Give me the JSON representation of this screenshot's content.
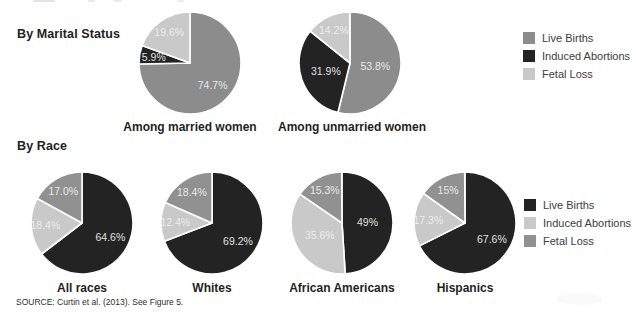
{
  "sections": {
    "marital": {
      "label": "By Marital Status"
    },
    "race": {
      "label": "By Race"
    }
  },
  "legend_top": {
    "items": [
      {
        "label": "Live Births",
        "color": "#8c8c8c"
      },
      {
        "label": "Induced Abortions",
        "color": "#232323"
      },
      {
        "label": "Fetal Loss",
        "color": "#c9c9c9"
      }
    ]
  },
  "legend_bottom": {
    "items": [
      {
        "label": "Live Births",
        "color": "#232323"
      },
      {
        "label": "Induced Abortions",
        "color": "#c9c9c9"
      },
      {
        "label": "Fetal Loss",
        "color": "#919191"
      }
    ]
  },
  "source": "SOURCE: Curtin et al. (2013). See Figure 5.",
  "chart_data": [
    {
      "type": "pie",
      "group": "By Marital Status",
      "title": "Among married women",
      "labels": [
        "Live Births",
        "Induced Abortions",
        "Fetal Loss"
      ],
      "values": [
        74.7,
        5.9,
        19.6
      ],
      "value_labels": [
        "74.7%",
        "5.9%",
        "19.6%"
      ],
      "colors": [
        "#8c8c8c",
        "#232323",
        "#c9c9c9"
      ],
      "start_angle": "top",
      "direction": "clockwise"
    },
    {
      "type": "pie",
      "group": "By Marital Status",
      "title": "Among unmarried women",
      "labels": [
        "Live Births",
        "Induced Abortions",
        "Fetal Loss"
      ],
      "values": [
        53.8,
        31.9,
        14.2
      ],
      "value_labels": [
        "53.8%",
        "31.9%",
        "14.2%"
      ],
      "colors": [
        "#8c8c8c",
        "#232323",
        "#c9c9c9"
      ],
      "start_angle": "top",
      "direction": "clockwise"
    },
    {
      "type": "pie",
      "group": "By Race",
      "title": "All races",
      "labels": [
        "Live Births",
        "Induced Abortions",
        "Fetal Loss"
      ],
      "values": [
        64.6,
        18.4,
        17.0
      ],
      "value_labels": [
        "64.6%",
        "18.4%",
        "17.0%"
      ],
      "colors": [
        "#232323",
        "#c9c9c9",
        "#919191"
      ],
      "start_angle": "top",
      "direction": "clockwise"
    },
    {
      "type": "pie",
      "group": "By Race",
      "title": "Whites",
      "labels": [
        "Live Births",
        "Induced Abortions",
        "Fetal Loss"
      ],
      "values": [
        69.2,
        12.4,
        18.4
      ],
      "value_labels": [
        "69.2%",
        "12.4%",
        "18.4%"
      ],
      "colors": [
        "#232323",
        "#c9c9c9",
        "#919191"
      ],
      "start_angle": "top",
      "direction": "clockwise"
    },
    {
      "type": "pie",
      "group": "By Race",
      "title": "African Americans",
      "labels": [
        "Live Births",
        "Induced Abortions",
        "Fetal Loss"
      ],
      "values": [
        49,
        35.6,
        15.3
      ],
      "value_labels": [
        "49%",
        "35.6%",
        "15.3%"
      ],
      "colors": [
        "#232323",
        "#c9c9c9",
        "#919191"
      ],
      "start_angle": "top",
      "direction": "clockwise"
    },
    {
      "type": "pie",
      "group": "By Race",
      "title": "Hispanics",
      "labels": [
        "Live Births",
        "Induced Abortions",
        "Fetal Loss"
      ],
      "values": [
        67.6,
        17.3,
        15
      ],
      "value_labels": [
        "67.6%",
        "17.3%",
        "15%"
      ],
      "colors": [
        "#232323",
        "#c9c9c9",
        "#919191"
      ],
      "start_angle": "top",
      "direction": "clockwise"
    }
  ]
}
